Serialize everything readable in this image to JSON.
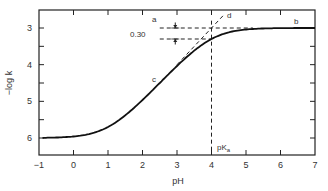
{
  "chart_data": {
    "type": "line",
    "title": "",
    "xlabel": "pH",
    "ylabel": "−log k",
    "xlim": [
      -1,
      7
    ],
    "ylim": [
      6.5,
      2.5
    ],
    "y_inverted": true,
    "x_ticks": [
      "−1",
      "0",
      "1",
      "2",
      "3",
      "4",
      "5",
      "6",
      "7"
    ],
    "y_ticks": [
      "3",
      "4",
      "5",
      "6"
    ],
    "grid": false,
    "series": [
      {
        "name": "-log k vs pH",
        "x": [
          -0.9,
          -0.5,
          0,
          0.5,
          1,
          1.5,
          2,
          2.5,
          3,
          3.5,
          4,
          4.5,
          5,
          5.5,
          6,
          7
        ],
        "values": [
          6.0,
          5.99,
          5.96,
          5.88,
          5.7,
          5.42,
          5.0,
          4.55,
          4.05,
          3.6,
          3.3,
          3.12,
          3.04,
          3.01,
          3.0,
          3.0
        ]
      }
    ],
    "reference_lines": [
      {
        "name": "b",
        "type": "horizontal_asymptote",
        "y": 3.0
      },
      {
        "name": "d",
        "type": "slope_one_asymptote",
        "through": [
          4,
          3
        ]
      },
      {
        "name": "pKa",
        "type": "vertical",
        "x": 4
      }
    ],
    "annotations": [
      {
        "text": "a",
        "x": 3.1,
        "y": 2.9
      },
      {
        "text": "b",
        "x": 6.4,
        "y": 2.95
      },
      {
        "text": "c",
        "x": 2.5,
        "y": 4.5
      },
      {
        "text": "d",
        "x": 4.3,
        "y": 2.7
      },
      {
        "text": "0.30",
        "x": 2.6,
        "y": 3.15
      },
      {
        "text": "pKₐ",
        "x": 4.1,
        "y": 6.2
      }
    ]
  },
  "labels": {
    "xlabel": "pH",
    "ylabel": "−log k",
    "a": "a",
    "b": "b",
    "c": "c",
    "d": "d",
    "gap": "0.30",
    "pka": "pK",
    "pka_sub": "a"
  }
}
